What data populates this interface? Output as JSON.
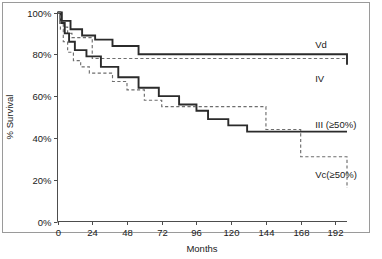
{
  "chart_data": {
    "type": "line",
    "title": "",
    "subtitle": "",
    "xlabel": "Months",
    "ylabel": "% Survival",
    "xlim": [
      0,
      200
    ],
    "ylim": [
      0,
      100
    ],
    "xticks": [
      0,
      24,
      48,
      72,
      96,
      120,
      144,
      168,
      192
    ],
    "xtick_labels": [
      "0",
      "24",
      "48",
      "72",
      "96",
      "120",
      "144",
      "168",
      "192"
    ],
    "yticks": [
      0,
      20,
      40,
      60,
      80,
      100
    ],
    "ytick_labels": [
      "0%",
      "20%",
      "40%",
      "60%",
      "80%",
      "100%"
    ],
    "grid": false,
    "legend_position": "inline-right",
    "step_type": "post",
    "series": [
      {
        "name": "Vd",
        "label": "Vd",
        "style": "dashed",
        "color": "#6e6e6e",
        "label_x": 178,
        "label_y": 83,
        "x": [
          0,
          2,
          4,
          7,
          10,
          24,
          200
        ],
        "y": [
          100,
          96,
          93,
          90,
          88,
          78,
          78
        ]
      },
      {
        "name": "IV",
        "label": "IV",
        "style": "solid",
        "color": "#2b2b2b",
        "label_x": 178,
        "label_y": 67,
        "x": [
          0,
          3,
          9,
          17,
          26,
          38,
          56,
          112,
          200
        ],
        "y": [
          100,
          96,
          92,
          89,
          87,
          84,
          80,
          80,
          75
        ]
      },
      {
        "name": "III (≥50%)",
        "label": "III (≥50%)",
        "style": "solid",
        "color": "#2b2b2b",
        "label_x": 178,
        "label_y": 45,
        "x": [
          0,
          2,
          5,
          8,
          12,
          20,
          30,
          42,
          56,
          70,
          84,
          96,
          104,
          118,
          131,
          200
        ],
        "y": [
          100,
          95,
          90,
          86,
          82,
          79,
          74,
          69,
          64,
          60,
          56,
          53,
          49,
          46,
          43,
          43
        ]
      },
      {
        "name": "Vc(≥50%)",
        "label": "Vc(≥50%)",
        "style": "dashed",
        "color": "#6e6e6e",
        "label_x": 178,
        "label_y": 21,
        "x": [
          0,
          2,
          4,
          7,
          11,
          16,
          22,
          30,
          38,
          48,
          60,
          72,
          96,
          131,
          144,
          168,
          200
        ],
        "y": [
          100,
          92,
          86,
          81,
          77,
          74,
          71,
          71,
          67,
          63,
          58,
          55,
          55,
          55,
          44,
          31,
          16
        ]
      }
    ]
  },
  "labels": {
    "vd": "Vd",
    "iv": "IV",
    "iii": "III (≥50%)",
    "vc": "Vc(≥50%)"
  }
}
